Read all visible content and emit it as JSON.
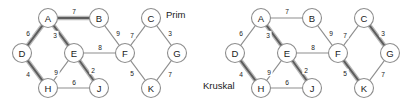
{
  "figure": {
    "type": "graph-diagram",
    "background_color": "#ffffff",
    "node_fill_color": "#ffffff",
    "node_stroke_color": "#8d8d8d",
    "edge_color": "#8d8d8d",
    "mst_halo_color": "#b9b9b9",
    "mst_core_color": "#5d5d5d",
    "text_color": "#1a1a1a"
  },
  "panels": [
    {
      "id": "prim",
      "label": "Prim",
      "label_pos": {
        "x": 166,
        "y": 14
      },
      "nodes": [
        {
          "id": "A",
          "label": "A",
          "x": 48,
          "y": 18
        },
        {
          "id": "B",
          "label": "B",
          "x": 99,
          "y": 18
        },
        {
          "id": "C",
          "label": "C",
          "x": 151,
          "y": 18
        },
        {
          "id": "D",
          "label": "D",
          "x": 22,
          "y": 53
        },
        {
          "id": "E",
          "label": "E",
          "x": 74,
          "y": 53
        },
        {
          "id": "F",
          "label": "F",
          "x": 125,
          "y": 53
        },
        {
          "id": "G",
          "label": "G",
          "x": 177,
          "y": 53
        },
        {
          "id": "H",
          "label": "H",
          "x": 48,
          "y": 88
        },
        {
          "id": "J",
          "label": "J",
          "x": 99,
          "y": 88
        },
        {
          "id": "K",
          "label": "K",
          "x": 151,
          "y": 88
        }
      ],
      "edges": [
        {
          "from": "A",
          "to": "B",
          "weight": 7,
          "mst": true,
          "label_pos": {
            "x": 74,
            "y": 11
          }
        },
        {
          "from": "A",
          "to": "D",
          "weight": 6,
          "mst": true,
          "label_pos": {
            "x": 28,
            "y": 33
          }
        },
        {
          "from": "A",
          "to": "E",
          "weight": 3,
          "mst": true,
          "label_pos": {
            "x": 55,
            "y": 35
          }
        },
        {
          "from": "B",
          "to": "F",
          "weight": 9,
          "mst": false,
          "label_pos": {
            "x": 118,
            "y": 33
          }
        },
        {
          "from": "C",
          "to": "F",
          "weight": 7,
          "mst": false,
          "label_pos": {
            "x": 132,
            "y": 35
          }
        },
        {
          "from": "C",
          "to": "G",
          "weight": 3,
          "mst": false,
          "label_pos": {
            "x": 170,
            "y": 33
          }
        },
        {
          "from": "D",
          "to": "H",
          "weight": 4,
          "mst": true,
          "label_pos": {
            "x": 28,
            "y": 74
          }
        },
        {
          "from": "E",
          "to": "F",
          "weight": 8,
          "mst": false,
          "label_pos": {
            "x": 100,
            "y": 47
          }
        },
        {
          "from": "E",
          "to": "H",
          "weight": 9,
          "mst": false,
          "label_pos": {
            "x": 56,
            "y": 72
          }
        },
        {
          "from": "E",
          "to": "J",
          "weight": 2,
          "mst": true,
          "label_pos": {
            "x": 93,
            "y": 70
          }
        },
        {
          "from": "F",
          "to": "K",
          "weight": 5,
          "mst": false,
          "label_pos": {
            "x": 132,
            "y": 73
          }
        },
        {
          "from": "G",
          "to": "K",
          "weight": 7,
          "mst": false,
          "label_pos": {
            "x": 170,
            "y": 74
          }
        },
        {
          "from": "H",
          "to": "J",
          "weight": 6,
          "mst": false,
          "label_pos": {
            "x": 74,
            "y": 82
          }
        }
      ],
      "mst_edges": [
        "A-B",
        "A-D",
        "A-E",
        "D-H",
        "E-J"
      ],
      "mst_total_weight": 22
    },
    {
      "id": "kruskal",
      "label": "Kruskal",
      "label_pos": {
        "x": 203,
        "y": 85
      },
      "nodes": [
        {
          "id": "A",
          "label": "A",
          "x": 261,
          "y": 18
        },
        {
          "id": "B",
          "label": "B",
          "x": 312,
          "y": 18
        },
        {
          "id": "C",
          "label": "C",
          "x": 364,
          "y": 18
        },
        {
          "id": "D",
          "label": "D",
          "x": 235,
          "y": 53
        },
        {
          "id": "E",
          "label": "E",
          "x": 287,
          "y": 53
        },
        {
          "id": "F",
          "label": "F",
          "x": 338,
          "y": 53
        },
        {
          "id": "G",
          "label": "G",
          "x": 390,
          "y": 53
        },
        {
          "id": "H",
          "label": "H",
          "x": 261,
          "y": 88
        },
        {
          "id": "J",
          "label": "J",
          "x": 312,
          "y": 88
        },
        {
          "id": "K",
          "label": "K",
          "x": 364,
          "y": 88
        }
      ],
      "edges": [
        {
          "from": "A",
          "to": "B",
          "weight": 7,
          "mst": false,
          "label_pos": {
            "x": 287,
            "y": 11
          }
        },
        {
          "from": "A",
          "to": "D",
          "weight": 6,
          "mst": false,
          "label_pos": {
            "x": 241,
            "y": 33
          }
        },
        {
          "from": "A",
          "to": "E",
          "weight": 3,
          "mst": true,
          "label_pos": {
            "x": 268,
            "y": 35
          }
        },
        {
          "from": "B",
          "to": "F",
          "weight": 9,
          "mst": false,
          "label_pos": {
            "x": 331,
            "y": 33
          }
        },
        {
          "from": "C",
          "to": "F",
          "weight": 7,
          "mst": false,
          "label_pos": {
            "x": 345,
            "y": 35
          }
        },
        {
          "from": "C",
          "to": "G",
          "weight": 3,
          "mst": true,
          "label_pos": {
            "x": 383,
            "y": 33
          }
        },
        {
          "from": "D",
          "to": "H",
          "weight": 4,
          "mst": true,
          "label_pos": {
            "x": 241,
            "y": 74
          }
        },
        {
          "from": "E",
          "to": "F",
          "weight": 8,
          "mst": false,
          "label_pos": {
            "x": 313,
            "y": 47
          }
        },
        {
          "from": "E",
          "to": "H",
          "weight": 9,
          "mst": false,
          "label_pos": {
            "x": 269,
            "y": 72
          }
        },
        {
          "from": "E",
          "to": "J",
          "weight": 2,
          "mst": true,
          "label_pos": {
            "x": 306,
            "y": 70
          }
        },
        {
          "from": "F",
          "to": "K",
          "weight": 5,
          "mst": true,
          "label_pos": {
            "x": 345,
            "y": 73
          }
        },
        {
          "from": "G",
          "to": "K",
          "weight": 7,
          "mst": false,
          "label_pos": {
            "x": 383,
            "y": 74
          }
        },
        {
          "from": "H",
          "to": "J",
          "weight": 6,
          "mst": false,
          "label_pos": {
            "x": 287,
            "y": 82
          }
        }
      ],
      "mst_edges": [
        "A-E",
        "C-G",
        "D-H",
        "E-J",
        "F-K"
      ],
      "mst_total_weight": 17
    }
  ],
  "node_radius": 9.5
}
